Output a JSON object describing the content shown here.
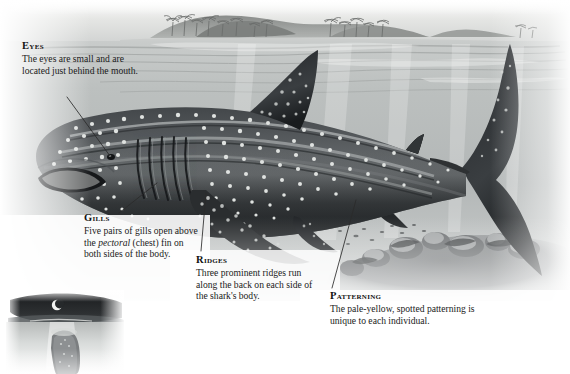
{
  "figure": {
    "style": "grayscale halftone illustration",
    "palette": {
      "sky": "#e9e9e7",
      "water_surface": "#cfd2d1",
      "water_deep": "#9ea4a4",
      "water_pale": "#ffffff",
      "shark_dark": "#2b2e30",
      "shark_mid": "#55585a",
      "shark_light": "#8d9193",
      "spot": "#e6e8e6",
      "seafloor": "#7d8082",
      "island": "#8b8e8c",
      "text": "#1a1a1a",
      "leader_line": "#2a2a2a"
    }
  },
  "callouts": [
    {
      "id": "eyes",
      "heading": "Eyes",
      "body": "The eyes are small and are located just behind the mouth.",
      "leader": {
        "from": [
          67,
          97
        ],
        "to": [
          110,
          156
        ]
      }
    },
    {
      "id": "gills",
      "heading": "Gills",
      "body_pre": "Five pairs of gills open above the ",
      "body_em": "pectoral",
      "body_post": " (chest) fin on both sides of the body.",
      "leader": {
        "from": [
          119,
          213
        ],
        "to": [
          157,
          183
        ]
      }
    },
    {
      "id": "ridges",
      "heading": "Ridges",
      "body": "Three prominent ridges run along the back on each side of the shark's body.",
      "leader": {
        "from": [
          201,
          251
        ],
        "to": [
          206,
          193
        ]
      }
    },
    {
      "id": "patterning",
      "heading": "Patterning",
      "body": "The pale-yellow, spotted patterning is unique to each individual.",
      "leader": {
        "from": [
          332,
          288
        ],
        "to": [
          356,
          200
        ]
      }
    }
  ],
  "scene": {
    "horizon_island": "island with palm trees on the horizon",
    "water_surface_label": "sea surface",
    "seafloor_label": "rocky seafloor with coral boulders",
    "shark_parts": [
      "blunt snout",
      "wide terminal mouth",
      "small eye",
      "five gill slits",
      "three dorsal ridges",
      "first dorsal fin",
      "second dorsal fin",
      "pectoral fin",
      "pelvic fin",
      "anal fin",
      "crescent caudal fin"
    ]
  },
  "inset": {
    "id": "night-inset",
    "description": "night scene with crescent moon above the water and shark below",
    "moon": "crescent-moon"
  }
}
